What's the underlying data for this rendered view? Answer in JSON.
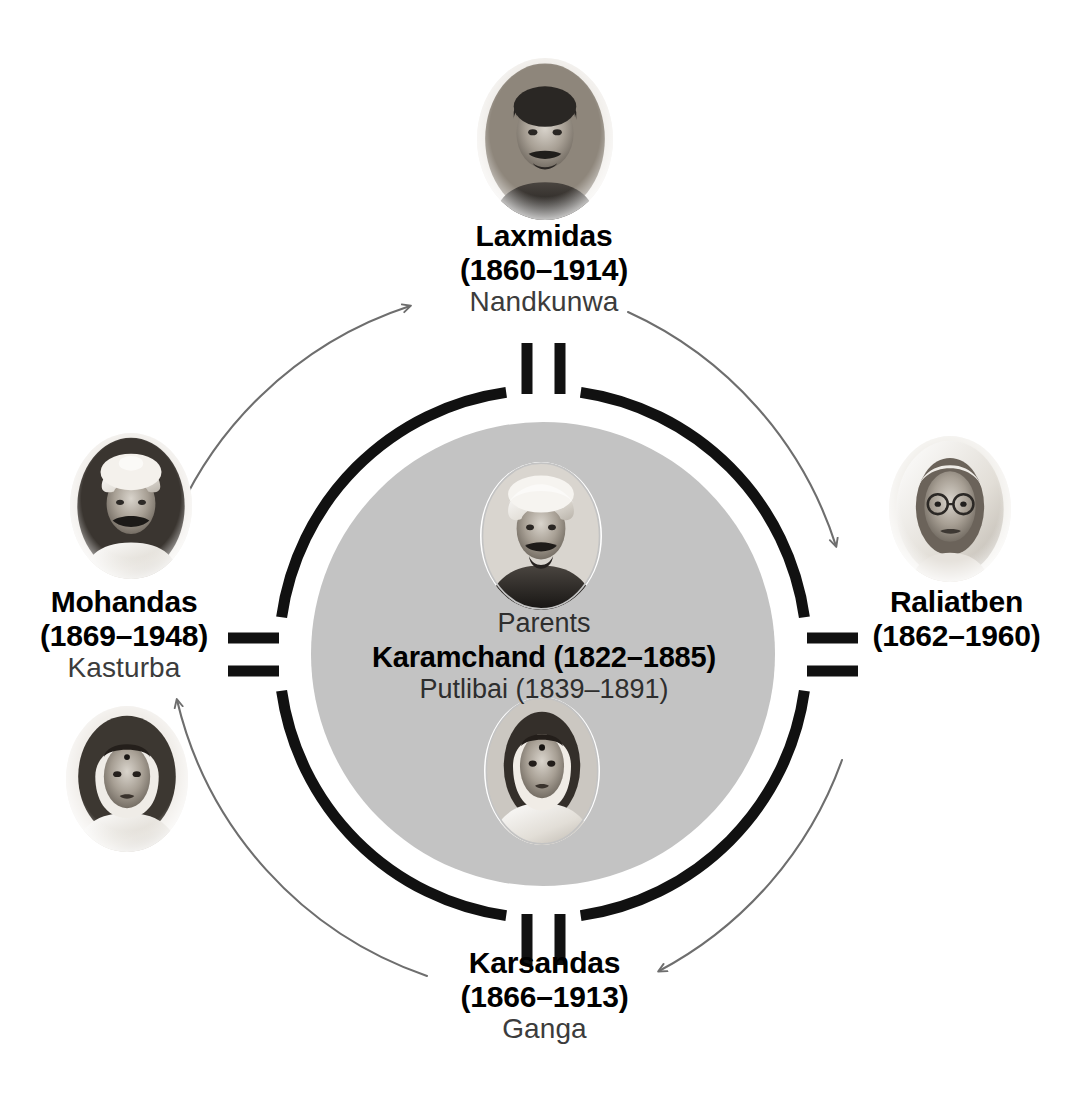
{
  "diagram": {
    "type": "family-circle",
    "center": {
      "caption": "Parents",
      "father": "Karamchand (1822–1885)",
      "mother": "Putlibai (1839–1891)",
      "father_portrait": "karamchand-portrait",
      "mother_portrait": "putlibai-portrait"
    },
    "colors": {
      "background": "#ffffff",
      "ring": "#111111",
      "disc_fill": "#c3c3c3",
      "arc_arrow": "#6e6e6e",
      "text_primary": "#000000",
      "text_secondary": "#3c3c3c"
    },
    "members": [
      {
        "id": "laxmidas",
        "position": "top",
        "name": "Laxmidas",
        "dates": "(1860–1914)",
        "spouse": "Nandkunwa",
        "portrait": "laxmidas-portrait"
      },
      {
        "id": "raliatben",
        "position": "right",
        "name": "Raliatben",
        "dates": "(1862–1960)",
        "spouse": "",
        "portrait": "raliatben-portrait"
      },
      {
        "id": "karsandas",
        "position": "bottom",
        "name": "Karsandas",
        "dates": "(1866–1913)",
        "spouse": "Ganga",
        "portrait": ""
      },
      {
        "id": "mohandas",
        "position": "left",
        "name": "Mohandas",
        "dates": "(1869–1948)",
        "spouse": "Kasturba",
        "portrait": "mohandas-portrait",
        "spouse_portrait": "kasturba-portrait"
      }
    ],
    "arrows": [
      {
        "id": "arrow-to-raliatben",
        "from": "laxmidas",
        "to": "raliatben",
        "direction": "clockwise"
      },
      {
        "id": "arrow-to-karsandas",
        "from": "raliatben",
        "to": "karsandas",
        "direction": "clockwise"
      },
      {
        "id": "arrow-to-mohandas",
        "from": "karsandas",
        "to": "mohandas",
        "direction": "clockwise"
      },
      {
        "id": "arrow-to-laxmidas",
        "from": "mohandas",
        "to": "laxmidas",
        "direction": "clockwise"
      }
    ]
  }
}
